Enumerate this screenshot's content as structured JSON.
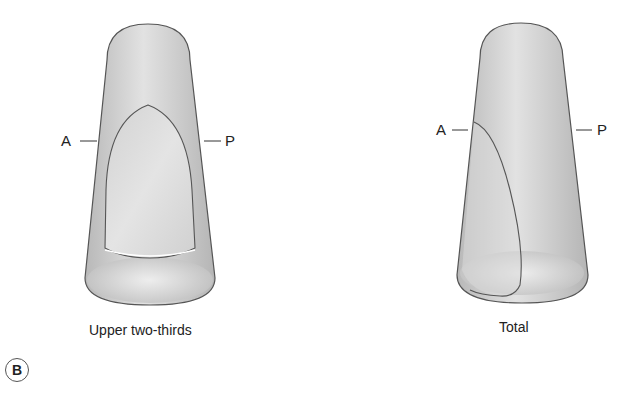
{
  "figure": {
    "panel_label": "B",
    "diagrams": [
      {
        "caption": "Upper two-thirds",
        "left_label": "A",
        "right_label": "P"
      },
      {
        "caption": "Total",
        "left_label": "A",
        "right_label": "P"
      }
    ],
    "colors": {
      "outline": "#555555",
      "body_fill": "#c8c8c8",
      "highlight": "#e6e6e6",
      "inner_fill": "#dcdcdc"
    }
  }
}
